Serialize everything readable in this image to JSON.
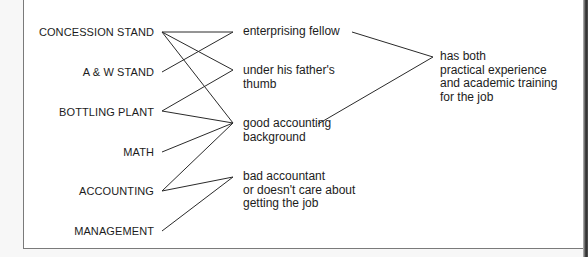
{
  "sources": [
    {
      "id": "concession",
      "label": "CONCESSION STAND"
    },
    {
      "id": "aw",
      "label": "A & W STAND"
    },
    {
      "id": "bottling",
      "label": "BOTTLING PLANT"
    },
    {
      "id": "math",
      "label": "MATH"
    },
    {
      "id": "accounting",
      "label": "ACCOUNTING"
    },
    {
      "id": "management",
      "label": "MANAGEMENT"
    }
  ],
  "inferences": [
    {
      "id": "enterprising",
      "lines": [
        "enterprising fellow"
      ]
    },
    {
      "id": "thumb",
      "lines": [
        "under his father's",
        "thumb"
      ]
    },
    {
      "id": "goodacct",
      "lines": [
        "good accounting",
        "background"
      ]
    },
    {
      "id": "badacct",
      "lines": [
        "bad accountant",
        "or doesn't care about",
        "getting the job"
      ]
    }
  ],
  "conclusion": {
    "id": "both",
    "lines": [
      "has both",
      "practical experience",
      "and academic training",
      "for the job"
    ]
  },
  "edges": [
    [
      "concession",
      "enterprising"
    ],
    [
      "concession",
      "thumb"
    ],
    [
      "concession",
      "goodacct"
    ],
    [
      "aw",
      "enterprising"
    ],
    [
      "bottling",
      "thumb"
    ],
    [
      "bottling",
      "goodacct"
    ],
    [
      "math",
      "goodacct"
    ],
    [
      "accounting",
      "goodacct"
    ],
    [
      "accounting",
      "badacct"
    ],
    [
      "management",
      "badacct"
    ],
    [
      "enterprising",
      "both"
    ],
    [
      "goodacct",
      "both"
    ]
  ]
}
